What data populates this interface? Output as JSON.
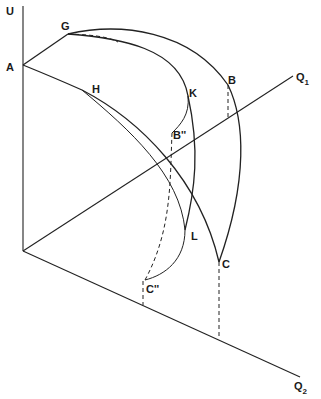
{
  "diagram": {
    "axes": {
      "u_label": "U",
      "q1_label": "Q",
      "q1_sub": "1",
      "q2_label": "Q",
      "q2_sub": "2"
    },
    "points": {
      "A": "A",
      "G": "G",
      "H": "H",
      "K": "K",
      "B": "B",
      "B2": "B''",
      "L": "L",
      "C": "C",
      "C2": "C''"
    },
    "colors": {
      "line": "#222222",
      "background": "#ffffff"
    }
  }
}
